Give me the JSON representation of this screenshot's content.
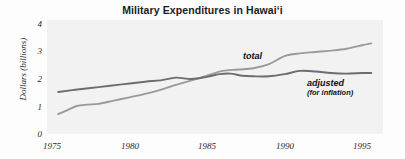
{
  "chart_data": {
    "type": "line",
    "title": "Military Expenditures in Hawai‘i",
    "xlabel": "",
    "ylabel": "Dollars (billions)",
    "xlim": [
      1975,
      1996
    ],
    "ylim": [
      0,
      4
    ],
    "xticks": [
      1975,
      1980,
      1985,
      1990,
      1995
    ],
    "xtick_labels": [
      "1975",
      "1980",
      "1985",
      "1990",
      "1995"
    ],
    "yticks": [
      0,
      1,
      2,
      3,
      4
    ],
    "ytick_labels": [
      "0",
      "1",
      "2",
      "3",
      "4"
    ],
    "grid": false,
    "legend": "inline-annotations",
    "series": [
      {
        "name": "total",
        "label": "total",
        "color": "#9a9a9a",
        "x": [
          1975.4,
          1976.0,
          1976.6,
          1977.3,
          1978.0,
          1979.0,
          1980.0,
          1981.0,
          1982.0,
          1983.0,
          1984.0,
          1985.0,
          1986.0,
          1987.0,
          1988.0,
          1989.0,
          1990.0,
          1991.0,
          1992.0,
          1993.0,
          1994.0,
          1995.0,
          1995.6
        ],
        "values": [
          0.7,
          0.85,
          1.0,
          1.05,
          1.08,
          1.2,
          1.32,
          1.45,
          1.6,
          1.78,
          1.95,
          2.12,
          2.3,
          2.35,
          2.4,
          2.55,
          2.85,
          2.95,
          3.0,
          3.05,
          3.12,
          3.25,
          3.32
        ]
      },
      {
        "name": "adjusted",
        "label": "adjusted",
        "sublabel": "(for inflation)",
        "color": "#6d6d6d",
        "x": [
          1975.4,
          1976.5,
          1978.0,
          1979.5,
          1981.0,
          1982.0,
          1983.0,
          1984.0,
          1985.0,
          1985.8,
          1986.5,
          1987.3,
          1988.0,
          1989.0,
          1990.0,
          1991.0,
          1992.0,
          1993.0,
          1994.0,
          1995.0,
          1995.6
        ],
        "values": [
          1.52,
          1.6,
          1.7,
          1.8,
          1.9,
          1.95,
          2.05,
          2.0,
          2.08,
          2.18,
          2.2,
          2.12,
          2.1,
          2.1,
          2.18,
          2.3,
          2.28,
          2.22,
          2.2,
          2.22,
          2.22
        ]
      }
    ],
    "annotations": [
      {
        "text": "total",
        "x": 1986.0,
        "y": 2.72
      },
      {
        "text": "adjusted",
        "x": 1990.2,
        "y": 1.78
      },
      {
        "text": "(for inflation)",
        "x": 1990.2,
        "y": 1.52
      }
    ]
  },
  "axis": {
    "y_label_text": "Dollars (billions)"
  }
}
